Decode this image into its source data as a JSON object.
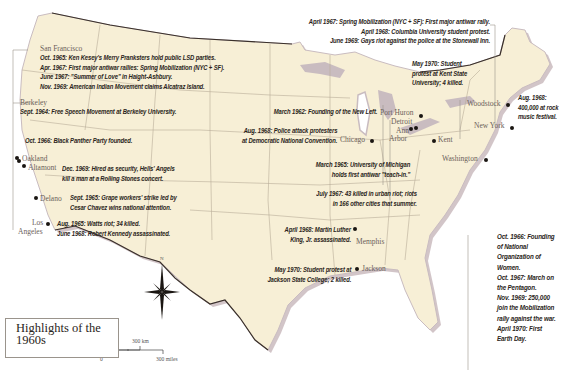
{
  "title": {
    "line1": "Highlights of the",
    "line2": "1960s"
  },
  "compass": {
    "north_label": "N"
  },
  "scale_bar": {
    "km_zero": "0",
    "km_label": "300 km",
    "mi_zero": "0",
    "mi_label": "300 miles"
  },
  "colors": {
    "land": "#f7efd6",
    "water_shore": "#c9bcc0",
    "border": "#3a302a",
    "state_lines": "#b8ad98",
    "text": "#2a2420"
  },
  "cities": {
    "san_francisco": "San Francisco",
    "berkeley": "Berkeley",
    "oakland": "Oakland",
    "altamont": "Altamont",
    "delano": "Delano",
    "los_angeles_1": "Los",
    "los_angeles_2": "Angeles",
    "port_huron": "Port Huron",
    "detroit": "Detroit",
    "ann_arbor_1": "Ann",
    "ann_arbor_2": "Arbor",
    "chicago": "Chicago",
    "kent": "Kent",
    "woodstock": "Woodstock",
    "new_york": "New York",
    "washington": "Washington",
    "memphis": "Memphis",
    "jackson": "Jackson"
  },
  "annotations": {
    "san_francisco": [
      "Oct. 1965: Ken Kesey's Merry Pranksters hold public LSD parties.",
      "Apr. 1967: First major antiwar rallies: Spring Mobilization (NYC + SF).",
      "June 1967: \"Summer of Love\" in Haight-Ashbury.",
      "Nov. 1969: American Indian Movement claims Alcatraz Island."
    ],
    "berkeley": [
      "Sept. 1964: Free Speech Movement at Berkeley University."
    ],
    "oakland": [
      "Oct. 1966: Black Panther Party founded."
    ],
    "altamont": [
      "Dec. 1969: Hired as security, Hells' Angels",
      "kill a man at a Rolling Stones concert."
    ],
    "delano": [
      "Sept. 1965: Grape workers' strike led by",
      "Cesar Chavez wins national attention."
    ],
    "los_angeles": [
      "Aug. 1965: Watts riot; 34 killed.",
      "June 1968: Robert Kennedy assassinated."
    ],
    "new_york_top": [
      "April 1967: Spring Mobilization (NYC + SF): First major antiwar rally.",
      "April 1968: Columbia University student protest.",
      "June 1969: Gays riot against the police at the Stonewall Inn."
    ],
    "kent": [
      "May 1970: Student",
      "protest at Kent State",
      "University; 4 killed."
    ],
    "woodstock": [
      "Aug. 1968:",
      "400,000 at rock",
      "music festival."
    ],
    "port_huron": [
      "March 1962: Founding of the New Left."
    ],
    "chicago": [
      "Aug. 1968: Police attack protesters",
      "at Democratic National Convention."
    ],
    "ann_arbor": [
      "March 1965: University of Michigan",
      "holds first antiwar \"teach-in.\""
    ],
    "detroit": [
      "July 1967: 43 killed in urban riot; riots",
      "in 166 other cities that summer."
    ],
    "memphis": [
      "April 1968: Martin Luther",
      "King, Jr. assassinated."
    ],
    "jackson": [
      "May 1970: Student protest at",
      "Jackson State College; 2 killed."
    ],
    "washington": [
      "Oct. 1966: Founding",
      "of National",
      "Organization of",
      "Women.",
      "Oct. 1967: March on",
      "the Pentagon.",
      "Nov. 1969: 250,000",
      "join the Mobilization",
      "rally against the war.",
      "April 1970: First",
      "Earth Day."
    ]
  }
}
